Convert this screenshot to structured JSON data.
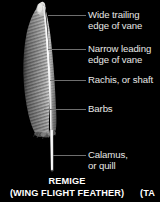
{
  "figure": {
    "background_color": "#000000",
    "label_color": "#e8e8e6",
    "leader_line_color": "#6e6e6e",
    "caption_color": "#ffffff",
    "illustration_name": "remige-feather-illustration",
    "illustration_description": "Grayscale photographic illustration of a single wing flight feather standing vertically, rounded tip at top, wide striated trailing vane on the left of a bright white rachis, narrow smooth leading vane on the right, wispy afterfeather barbs near the base, and a bare white calamus quill extending to the bottom."
  },
  "callouts": [
    {
      "id": "wide-trailing-edge-of-vane",
      "line1": "Wide trailing",
      "line2": "edge of vane"
    },
    {
      "id": "narrow-leading-edge-of-vane",
      "line1": "Narrow leading",
      "line2": "edge of vane"
    },
    {
      "id": "rachis-or-shaft",
      "line1": "Rachis, or shaft",
      "line2": ""
    },
    {
      "id": "barbs",
      "line1": "Barbs",
      "line2": ""
    },
    {
      "id": "calamus-or-quill",
      "line1": "Calamus,",
      "line2": "or quill"
    }
  ],
  "caption": {
    "title": "REMIGE",
    "subtitle": "(WING FLIGHT FEATHER)"
  },
  "neighbor_caption": {
    "fragment": "(TA"
  }
}
